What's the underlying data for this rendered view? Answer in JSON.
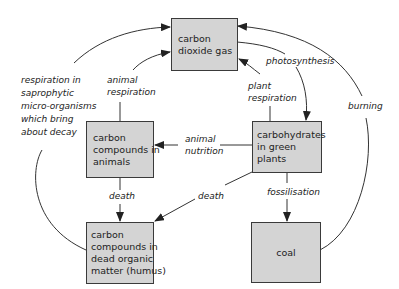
{
  "diagram": {
    "type": "carbon-cycle",
    "colors": {
      "box_fill": "#d4d4d4",
      "box_border": "#3a3a3a",
      "line": "#333333",
      "background": "#ffffff"
    },
    "nodes": {
      "co2": {
        "lines": [
          "carbon",
          "dioxide gas"
        ]
      },
      "animals": {
        "lines": [
          "carbon",
          "compounds in",
          "animals"
        ]
      },
      "plants": {
        "lines": [
          "carbohydrates",
          "in green",
          "plants"
        ]
      },
      "dead_matter": {
        "lines": [
          "carbon",
          "compounds in",
          "dead organic",
          "matter (humus)"
        ]
      },
      "coal": {
        "lines": [
          "coal"
        ]
      }
    },
    "edges": {
      "saprophytic": {
        "lines": [
          "respiration in",
          "saprophytic",
          "micro-organisms",
          "which bring",
          "about decay"
        ],
        "from": "dead_matter",
        "to": "co2"
      },
      "animal_respiration": {
        "lines": [
          "animal",
          "respiration"
        ],
        "from": "animals",
        "to": "co2"
      },
      "plant_respiration": {
        "lines": [
          "plant",
          "respiration"
        ],
        "from": "plants",
        "to": "co2"
      },
      "photosynthesis": {
        "lines": [
          "photosynthesis"
        ],
        "from": "co2",
        "to": "plants"
      },
      "burning": {
        "lines": [
          "burning"
        ],
        "from": "coal",
        "to": "co2"
      },
      "animal_nutrition": {
        "lines": [
          "animal",
          "nutrition"
        ],
        "from": "plants",
        "to": "animals"
      },
      "death_animals": {
        "lines": [
          "death"
        ],
        "from": "animals",
        "to": "dead_matter"
      },
      "death_plants": {
        "lines": [
          "death"
        ],
        "from": "plants",
        "to": "dead_matter"
      },
      "fossilisation": {
        "lines": [
          "fossilisation"
        ],
        "from": "plants",
        "to": "coal"
      }
    }
  }
}
